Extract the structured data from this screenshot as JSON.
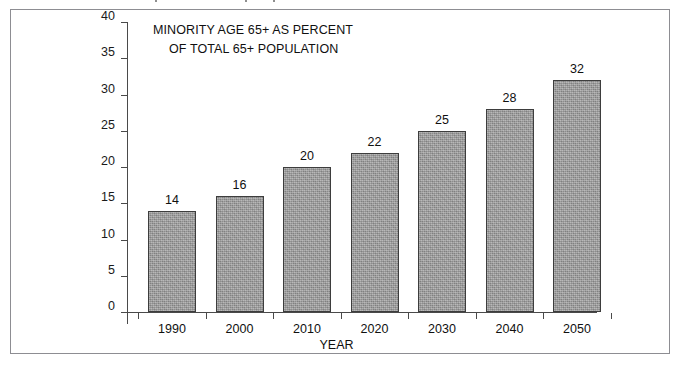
{
  "chart_data": {
    "type": "bar",
    "title": "MINORITY AGE 65+ AS PERCENT OF TOTAL 65+ POPULATION",
    "title_lines": [
      "MINORITY AGE 65+ AS PERCENT",
      "OF TOTAL 65+ POPULATION"
    ],
    "categories": [
      "1990",
      "2000",
      "2010",
      "2020",
      "2030",
      "2040",
      "2050"
    ],
    "values": [
      14,
      16,
      20,
      22,
      25,
      28,
      32
    ],
    "data_labels": [
      "14",
      "16",
      "20",
      "22",
      "25",
      "28",
      "32"
    ],
    "xlabel": "YEAR",
    "ylabel": "",
    "ylim": [
      0,
      40
    ],
    "ytick_values": [
      0,
      5,
      10,
      15,
      20,
      25,
      30,
      35,
      40
    ],
    "ytick_labels": [
      "0",
      "5",
      "10",
      "15",
      "20",
      "25",
      "30",
      "35",
      "40"
    ],
    "grid": false,
    "legend": false,
    "legend_position": "none",
    "series": [
      {
        "name": "Minority age 65+ as percent of total 65+ population",
        "values": [
          14,
          16,
          20,
          22,
          25,
          28,
          32
        ]
      }
    ],
    "colors": {
      "bar_fill": "#9b9b9b",
      "bar_outline": "#3d3d3d",
      "axis": "#4a4a4a",
      "text": "#101010",
      "frame": "#8d8d92",
      "background": "#ffffff"
    }
  }
}
